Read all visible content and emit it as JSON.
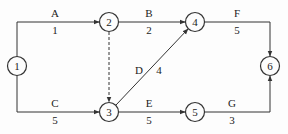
{
  "diagram": {
    "type": "activity-on-arrow network",
    "colors": {
      "stroke": "#333333",
      "text": "#222222",
      "background": "#fdfdfd"
    },
    "nodes": [
      {
        "id": "1",
        "label": "1",
        "x": 17,
        "y": 66
      },
      {
        "id": "2",
        "label": "2",
        "x": 109,
        "y": 22
      },
      {
        "id": "3",
        "label": "3",
        "x": 109,
        "y": 112
      },
      {
        "id": "4",
        "label": "4",
        "x": 195,
        "y": 22
      },
      {
        "id": "5",
        "label": "5",
        "x": 195,
        "y": 112
      },
      {
        "id": "6",
        "label": "6",
        "x": 270,
        "y": 66
      }
    ],
    "activities": [
      {
        "name": "A",
        "duration": "1",
        "from": "1",
        "to": "2",
        "dashed": false
      },
      {
        "name": "B",
        "duration": "2",
        "from": "2",
        "to": "4",
        "dashed": false
      },
      {
        "name": "C",
        "duration": "5",
        "from": "1",
        "to": "3",
        "dashed": false
      },
      {
        "name": "D",
        "duration": "4",
        "from": "3",
        "to": "4",
        "dashed": false
      },
      {
        "name": "E",
        "duration": "5",
        "from": "3",
        "to": "5",
        "dashed": false
      },
      {
        "name": "F",
        "duration": "5",
        "from": "4",
        "to": "6",
        "dashed": false
      },
      {
        "name": "G",
        "duration": "3",
        "from": "5",
        "to": "6",
        "dashed": false
      },
      {
        "name": "",
        "duration": "",
        "from": "2",
        "to": "3",
        "dashed": true,
        "note": "dummy activity"
      }
    ]
  }
}
